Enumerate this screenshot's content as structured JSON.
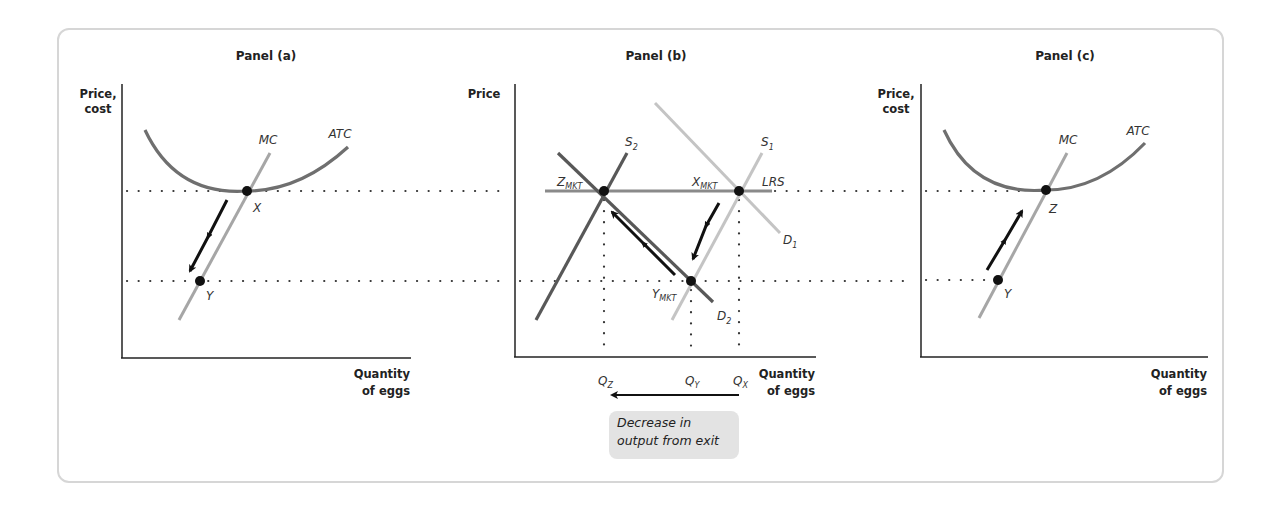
{
  "panels": [
    {
      "title": "Panel (a)",
      "y_axis_label": [
        "Price,",
        "cost"
      ],
      "x_axis_label": [
        "Quantity",
        "of eggs"
      ],
      "curves": [
        {
          "name": "ATC"
        },
        {
          "name": "MC"
        }
      ],
      "points": [
        {
          "label": "X"
        },
        {
          "label": "Y"
        }
      ]
    },
    {
      "title": "Panel (b)",
      "y_axis_label": [
        "Price"
      ],
      "x_axis_label": [
        "Quantity",
        "of eggs"
      ],
      "curves": [
        {
          "name": "S",
          "sub": "2"
        },
        {
          "name": "S",
          "sub": "1"
        },
        {
          "name": "D",
          "sub": "1"
        },
        {
          "name": "D",
          "sub": "2"
        },
        {
          "name": "LRS",
          "sub": ""
        }
      ],
      "points": [
        {
          "label": "Z",
          "sub": "MKT"
        },
        {
          "label": "X",
          "sub": "MKT"
        },
        {
          "label": "Y",
          "sub": "MKT"
        }
      ],
      "quantities": [
        {
          "label": "Q",
          "sub": "Z"
        },
        {
          "label": "Q",
          "sub": "Y"
        },
        {
          "label": "Q",
          "sub": "X"
        }
      ],
      "note": "Decrease in\noutput from exit"
    },
    {
      "title": "Panel (c)",
      "y_axis_label": [
        "Price,",
        "cost"
      ],
      "x_axis_label": [
        "Quantity",
        "of eggs"
      ],
      "curves": [
        {
          "name": "ATC"
        },
        {
          "name": "MC"
        }
      ],
      "points": [
        {
          "label": "Z"
        },
        {
          "label": "Y"
        }
      ]
    }
  ],
  "colors": {
    "atc": "#6f6f6f",
    "mc": "#a6a6a6",
    "s2_d2": "#585858",
    "s1_d1": "#c4c4c4",
    "lrs": "#8a8a8a",
    "arrow": "#111111",
    "note_bg": "#e3e3e3"
  }
}
